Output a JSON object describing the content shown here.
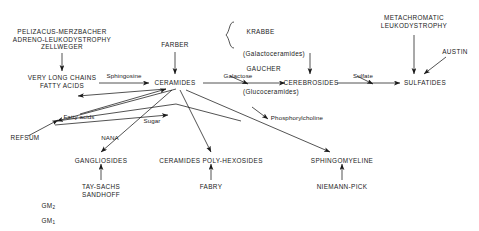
{
  "diagram": {
    "ink_color": "#1a1a1a",
    "background_color": "#ffffff"
  },
  "nodes": {
    "pelizacus_block": "PELIZACUS-MERZBACHER\nADRENO-LEUKODYSTROPHY\nZELLWEGER",
    "very_long_chains": "VERY LONG CHAINS\nFATTY ACIDS",
    "refsum": "REFSUM",
    "farber": "FARBER",
    "ceramides": "CERAMIDES",
    "krabbe_line1": "KRABBE",
    "krabbe_line2": "(Galactoceramides)",
    "gaucher_line1": "GAUCHER",
    "gaucher_line2": "(Glucoceramides)",
    "cerebrosides": "CEREBROSIDES",
    "metachromatic": "METACHROMATIC\nLEUKODYSTROPHY",
    "austin": "AUSTIN",
    "sulfatides": "SULFATIDES",
    "gangliosides": "GANGLIOSIDES",
    "ceramides_poly": "CERAMIDES POLY-HEXOSIDES",
    "sphingomyeline": "SPHINGOMYELINE",
    "tay_sachs": "TAY-SACHS\nSANDHOFF",
    "fabry": "FABRY",
    "niemann_pick": "NIEMANN-PICK",
    "gm_series_1": "GM",
    "gm_series_1_sub": "2",
    "gm_series_2": "GM",
    "gm_series_2_sub": "1",
    "gm_series_3": "GM",
    "gm_series_3_sub": "3"
  },
  "edge_labels": {
    "sphingosine": "Sphingosine",
    "fatty_acids": "Fatty acids",
    "sugar": "Sugar",
    "nana": "NANA",
    "galactose": "Galactose",
    "sulfate": "Sulfate",
    "phosphorylcholine": "Phosphorylcholine"
  }
}
